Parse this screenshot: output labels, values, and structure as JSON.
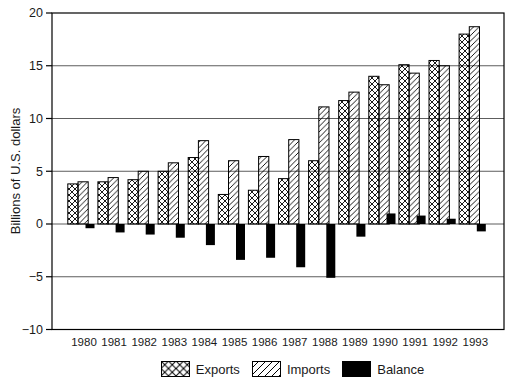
{
  "chart_data": {
    "type": "bar",
    "title": "",
    "xlabel": "",
    "ylabel": "Billions of U.S. dollars",
    "ylim": [
      -10,
      20
    ],
    "yticks": [
      20,
      15,
      10,
      5,
      0,
      -5,
      -10
    ],
    "gridlines_at": [
      15,
      10,
      5,
      0,
      -5
    ],
    "grid": true,
    "legend_position": "bottom",
    "categories": [
      "1980",
      "1981",
      "1982",
      "1983",
      "1984",
      "1985",
      "1986",
      "1987",
      "1988",
      "1989",
      "1990",
      "1991",
      "1992",
      "1993"
    ],
    "series": [
      {
        "name": "Exports",
        "style": "crosshatch",
        "values": [
          3.8,
          4.0,
          4.2,
          5.0,
          6.3,
          2.8,
          3.2,
          4.3,
          6.0,
          11.7,
          14.0,
          15.1,
          15.5,
          18.0
        ]
      },
      {
        "name": "Imports",
        "style": "diagonal-hatch",
        "values": [
          4.0,
          4.4,
          5.0,
          5.8,
          7.9,
          6.0,
          6.4,
          8.0,
          11.1,
          12.5,
          13.2,
          14.3,
          15.0,
          18.7
        ]
      },
      {
        "name": "Balance",
        "style": "solid-black",
        "values": [
          -0.4,
          -0.8,
          -1.0,
          -1.3,
          -2.0,
          -3.4,
          -3.2,
          -4.1,
          -5.1,
          -1.2,
          1.0,
          0.8,
          0.5,
          -0.7
        ]
      }
    ],
    "colors": {
      "ink": "#000000",
      "gridline": "#333333",
      "background": "#ffffff"
    }
  },
  "legend": {
    "items": [
      {
        "label": "Exports",
        "swatch": "crosshatch"
      },
      {
        "label": "Imports",
        "swatch": "diagonal-hatch"
      },
      {
        "label": "Balance",
        "swatch": "solid-black"
      }
    ]
  }
}
